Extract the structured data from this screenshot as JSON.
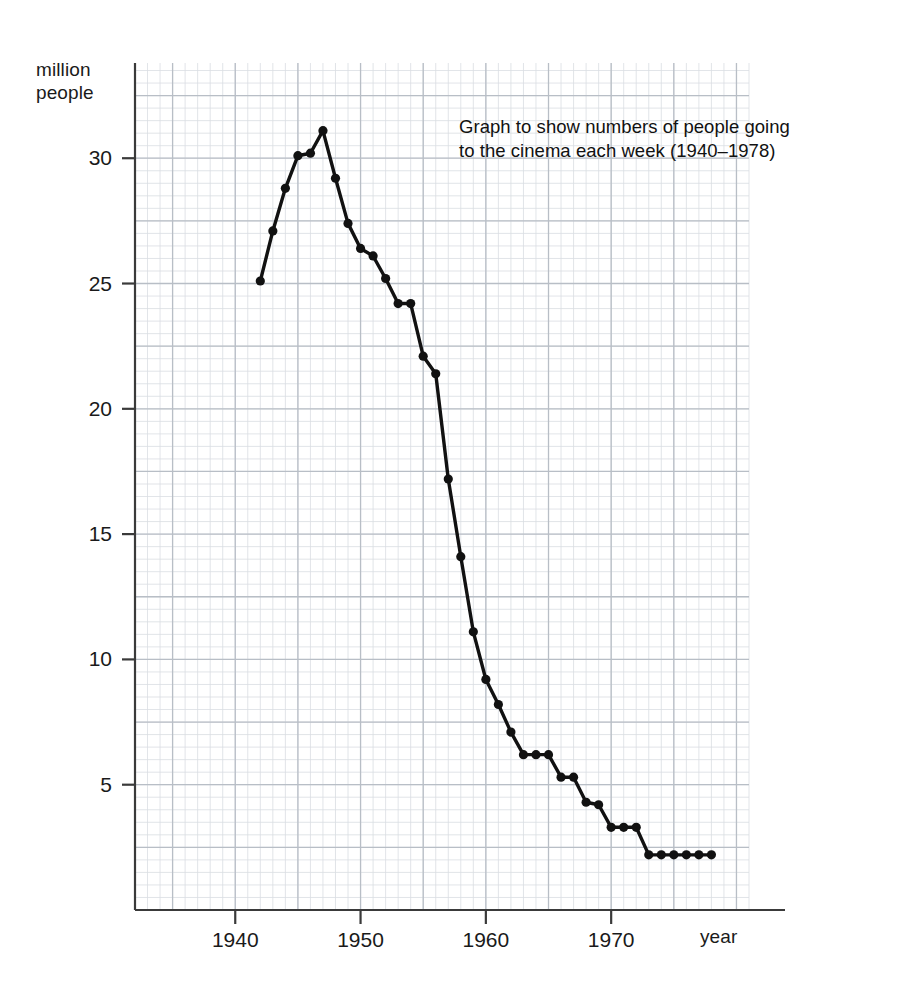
{
  "chart_data": {
    "type": "line",
    "title_line1": "Graph to show numbers of people going",
    "title_line2": "to the cinema each week (1940–1978)",
    "xlabel": "year",
    "ylabel": "million\npeople",
    "ylabel_line1": "million",
    "ylabel_line2": "people",
    "xlim": [
      1932,
      1981
    ],
    "ylim": [
      0,
      33.8
    ],
    "xticks": [
      1940,
      1950,
      1960,
      1970
    ],
    "xtick_labels": [
      "1940",
      "1950",
      "1960",
      "1970"
    ],
    "yticks": [
      5,
      10,
      15,
      20,
      25,
      30
    ],
    "ytick_labels": [
      "5",
      "10",
      "15",
      "20",
      "25",
      "30"
    ],
    "grid": true,
    "grid_minor_step_x": 1,
    "grid_minor_step_y": 0.5,
    "grid_major_step_x": 5,
    "grid_major_step_y": 2.5,
    "legend": "none",
    "marker": "filled-circle",
    "line_color": "#111111",
    "grid_minor_color": "#d9dde2",
    "grid_major_color": "#b8bec6",
    "axis_color": "#3a3a3a",
    "x": [
      1942,
      1943,
      1944,
      1945,
      1946,
      1947,
      1948,
      1949,
      1950,
      1951,
      1952,
      1953,
      1954,
      1955,
      1956,
      1957,
      1958,
      1959,
      1960,
      1961,
      1962,
      1963,
      1964,
      1965,
      1966,
      1967,
      1968,
      1969,
      1970,
      1971,
      1972,
      1973,
      1974,
      1975,
      1976,
      1977,
      1978
    ],
    "y": [
      25.1,
      27.1,
      28.8,
      30.1,
      30.2,
      31.1,
      29.2,
      27.4,
      26.4,
      26.1,
      25.2,
      24.2,
      24.2,
      22.1,
      21.4,
      17.2,
      14.1,
      11.1,
      9.2,
      8.2,
      7.1,
      6.2,
      6.2,
      6.2,
      5.3,
      5.3,
      4.3,
      4.2,
      3.3,
      3.3,
      3.3,
      2.2,
      2.2,
      2.2,
      2.2,
      2.2,
      2.2
    ],
    "series_name": "weekly cinema admissions",
    "units": "million people"
  },
  "geometry": {
    "plot_left": 135,
    "plot_right": 749,
    "plot_top": 63,
    "plot_bottom": 910
  }
}
